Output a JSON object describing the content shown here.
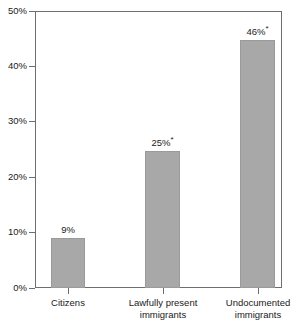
{
  "chart_data": {
    "type": "bar",
    "title": "",
    "subtitle": "",
    "xlabel": "",
    "ylabel": "",
    "ylim": [
      0,
      50
    ],
    "grid": false,
    "legend": "none",
    "categories": [
      "Citizens",
      "Lawfully present immigrants",
      "Undocumented immigrants"
    ],
    "category_lines": [
      [
        "Citizens"
      ],
      [
        "Lawfully present",
        "immigrants"
      ],
      [
        "Undocumented",
        "immigrants"
      ]
    ],
    "values": [
      9,
      25,
      46
    ],
    "bar_tops_percent": [
      9,
      24.7,
      44.7
    ],
    "data_labels": [
      "9%",
      "25%*",
      "46%*"
    ],
    "data_label_numbers": [
      "9%",
      "25%",
      "46%"
    ],
    "data_label_markers": [
      "",
      "*",
      "*"
    ],
    "y_ticks": [
      "0%",
      "10%",
      "20%",
      "30%",
      "40%",
      "50%"
    ],
    "y_tick_values": [
      0,
      10,
      20,
      30,
      40,
      50
    ],
    "colors": {
      "bar_fill": "#a8a8a8",
      "bar_stroke": "#9a9a9a",
      "axis": "#6e6e6e",
      "text": "#1a1a1a",
      "background": "#ffffff"
    }
  }
}
